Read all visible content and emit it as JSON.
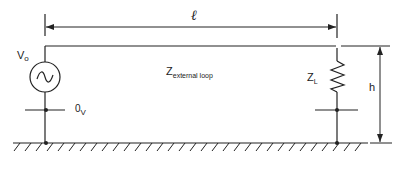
{
  "diagram": {
    "type": "transmission-line-over-ground-plane",
    "labels": {
      "length": "ℓ",
      "source_main": "V",
      "source_sub": "o",
      "reference_main": "0",
      "reference_sub": "V",
      "impedance_main": "Z",
      "impedance_sub": "external loop",
      "load_main": "Z",
      "load_sub": "L",
      "height": "h"
    },
    "components": [
      {
        "id": "source",
        "kind": "ac-voltage-source",
        "label": "Vo"
      },
      {
        "id": "load",
        "kind": "resistor",
        "label": "ZL"
      },
      {
        "id": "ground",
        "kind": "ground-plane"
      },
      {
        "id": "wire",
        "kind": "conductor"
      }
    ],
    "dimensions": [
      {
        "name": "length",
        "symbol": "ℓ",
        "orientation": "horizontal"
      },
      {
        "name": "height",
        "symbol": "h",
        "orientation": "vertical"
      }
    ],
    "colors": {
      "line": "#222222",
      "background": "#ffffff"
    }
  }
}
